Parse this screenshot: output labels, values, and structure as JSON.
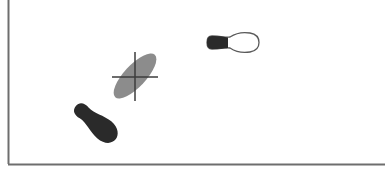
{
  "diagram": {
    "elements": [
      {
        "id": "footprint-filled",
        "kind": "footprint",
        "fill": "dark",
        "label": ""
      },
      {
        "id": "pressure-ellipse",
        "kind": "ellipse-with-crosshair",
        "fill": "grey",
        "label": ""
      },
      {
        "id": "footprint-outline",
        "kind": "footprint",
        "fill": "heel-only",
        "label": ""
      }
    ]
  },
  "colors": {
    "background": "#ffffff",
    "frame": "#6e6e6e",
    "dark_fill": "#2a2a2a",
    "grey_fill": "#8c8c8c",
    "crosshair": "#3c3c3c",
    "outline": "#5a5a5a"
  }
}
